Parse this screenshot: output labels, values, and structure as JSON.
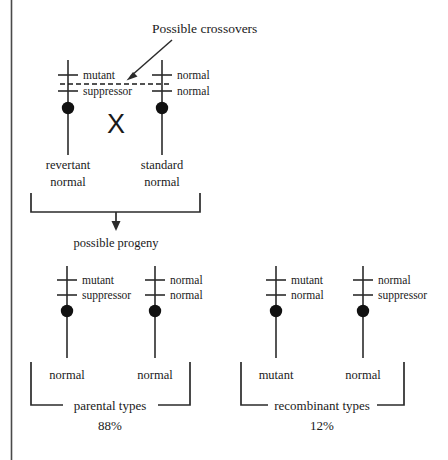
{
  "figure": {
    "title_annotation": "Possible crossovers",
    "cross_symbol": "X",
    "progeny_caption": "possible progeny",
    "left_rule": true
  },
  "parents": {
    "left": {
      "allele_top": "mutant",
      "allele_bottom": "suppressor",
      "phenotype_line1": "revertant",
      "phenotype_line2": "normal"
    },
    "right": {
      "allele_top": "normal",
      "allele_bottom": "normal",
      "phenotype_line1": "standard",
      "phenotype_line2": "normal"
    }
  },
  "progeny": {
    "groups": [
      {
        "name": "parental types",
        "percent": "88%",
        "chromosomes": [
          {
            "allele_top": "mutant",
            "allele_bottom": "suppressor",
            "phenotype": "normal"
          },
          {
            "allele_top": "normal",
            "allele_bottom": "normal",
            "phenotype": "normal"
          }
        ]
      },
      {
        "name": "recombinant types",
        "percent": "12%",
        "chromosomes": [
          {
            "allele_top": "mutant",
            "allele_bottom": "normal",
            "phenotype": "mutant"
          },
          {
            "allele_top": "normal",
            "allele_bottom": "suppressor",
            "phenotype": "normal"
          }
        ]
      }
    ]
  },
  "colors": {
    "ink": "#1a1a1a",
    "line": "#2b2b2b",
    "rule": "#4a4a4a",
    "background": "#ffffff"
  }
}
